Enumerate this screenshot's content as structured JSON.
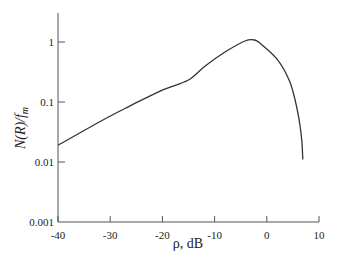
{
  "chart_data": {
    "type": "line",
    "title": "",
    "xlabel": "ρ, dB",
    "ylabel": "N(R)/f_m",
    "ylabel_parts": {
      "main": "N(R)/f",
      "sub": "m"
    },
    "xlim": [
      -40,
      10
    ],
    "ylim": [
      0.001,
      2.2
    ],
    "yscale": "log",
    "grid": false,
    "legend": null,
    "x_ticks": [
      -40,
      -30,
      -20,
      -10,
      0,
      10
    ],
    "x_tick_labels": [
      "-40",
      "-30",
      "-20",
      "-10",
      "0",
      "10"
    ],
    "y_ticks": [
      1,
      0.1,
      0.01,
      0.001
    ],
    "y_tick_labels": [
      "1",
      "0.1",
      "0.01",
      "0.001"
    ],
    "series": [
      {
        "name": "N(R)/f_m",
        "color": "#333333",
        "x": [
          -40,
          -32,
          -26.2,
          -19.9,
          -15.1,
          -11.8,
          -8.0,
          -4.2,
          -2.3,
          -0.9,
          2.1,
          4.3,
          5.4,
          6.2,
          6.7,
          6.9
        ],
        "y": [
          0.019,
          0.047,
          0.086,
          0.16,
          0.23,
          0.4,
          0.68,
          1.04,
          1.08,
          0.89,
          0.5,
          0.23,
          0.11,
          0.05,
          0.023,
          0.011
        ]
      }
    ]
  }
}
